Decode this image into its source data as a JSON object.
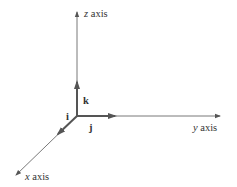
{
  "diagram": {
    "axes": {
      "z": {
        "label_var": "z",
        "label_word": " axis"
      },
      "y": {
        "label_var": "y",
        "label_word": " axis"
      },
      "x": {
        "label_var": "x",
        "label_word": " axis"
      }
    },
    "vectors": {
      "i": "i",
      "j": "j",
      "k": "k"
    },
    "colors": {
      "axis": "#6a6a6a",
      "vector": "#555555",
      "text": "#333333"
    }
  }
}
